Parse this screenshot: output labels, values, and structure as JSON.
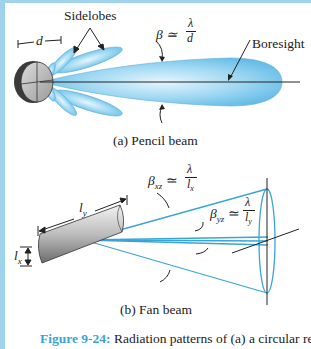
{
  "figure": {
    "number": "Figure 9-24:",
    "caption": "Radiation patterns of (a) a circular reflector",
    "accent_color": "#3aa5d4",
    "beam_color": "#8fd0f0",
    "line_color": "#3aa5d4"
  },
  "panel_a": {
    "subcaption": "(a)  Pencil beam",
    "labels": {
      "sidelobes": "Sidelobes",
      "diameter": "d",
      "beamwidth": "β ≃ λ/d",
      "beam_symbol": "β ≃",
      "lambda": "λ",
      "d_den": "d",
      "boresight": "Boresight"
    }
  },
  "panel_b": {
    "subcaption": "(b)  Fan beam",
    "labels": {
      "beta_xz": "β",
      "xz": "xz",
      "beta_yz": "β",
      "yz": "yz",
      "approx": "≃",
      "lambda": "λ",
      "lx": "l",
      "lx_sub": "x",
      "ly": "l",
      "ly_sub": "y"
    }
  }
}
